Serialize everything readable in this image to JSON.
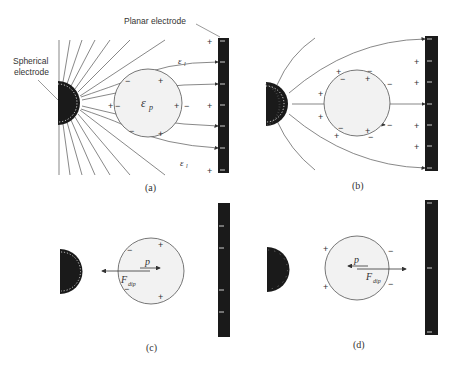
{
  "figure": {
    "labels": {
      "planar_electrode": "Planar electrode",
      "spherical_electrode_line1": "Spherical",
      "spherical_electrode_line2": "electrode"
    },
    "panels": [
      {
        "id": "a",
        "caption": "(a)",
        "particle_symbol": "ε",
        "particle_sub": "p",
        "medium_symbol": "ε",
        "medium_sub": "l"
      },
      {
        "id": "b",
        "caption": "(b)"
      },
      {
        "id": "c",
        "caption": "(c)",
        "dipole_symbol": "p",
        "force_symbol": "F",
        "force_sub": "dip"
      },
      {
        "id": "d",
        "caption": "(d)",
        "dipole_symbol": "p",
        "force_symbol": "F",
        "force_sub": "dip"
      }
    ],
    "charges": {
      "plus": "+",
      "minus": "−"
    },
    "colors": {
      "electrode": "#1a1a1a",
      "particle_fill": "#f2f2f2",
      "line": "#555555",
      "text": "#333333"
    }
  }
}
